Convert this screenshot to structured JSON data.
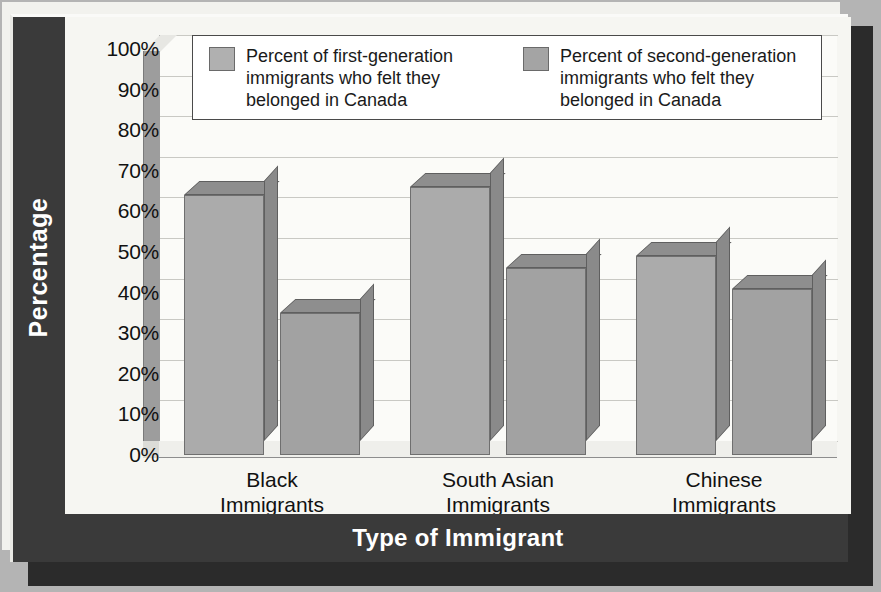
{
  "chart_data": {
    "type": "bar",
    "title": "",
    "subtitle": "",
    "xlabel": "Type of Immigrant",
    "ylabel": "Percentage",
    "categories": [
      "Black\nImmigrants",
      "South Asian\nImmigrants",
      "Chinese\nImmigrants"
    ],
    "category_lines": [
      [
        "Black",
        "Immigrants"
      ],
      [
        "South Asian",
        "Immigrants"
      ],
      [
        "Chinese",
        "Immigrants"
      ]
    ],
    "series": [
      {
        "name": "Percent of first-generation immigrants who felt they belonged in Canada",
        "values": [
          64,
          66,
          49
        ],
        "color": "#ababab"
      },
      {
        "name": "Percent of second-generation immigrants who felt they belonged in Canada",
        "values": [
          35,
          46,
          41
        ],
        "color": "#a2a2a2"
      }
    ],
    "ylim": [
      0,
      100
    ],
    "ytick_values": [
      100,
      90,
      80,
      70,
      60,
      50,
      40,
      30,
      20,
      10,
      0
    ],
    "ytick_labels": [
      "100%",
      "90%",
      "80%",
      "70%",
      "60%",
      "50%",
      "40%",
      "30%",
      "20%",
      "10%",
      "0%"
    ],
    "grid": true,
    "legend_position": "top-inside",
    "style": "3d-bar"
  },
  "legend": {
    "items": [
      {
        "swatch": "a",
        "lines": [
          "Percent of first-generation",
          "immigrants who felt they",
          "belonged in Canada"
        ]
      },
      {
        "swatch": "b",
        "lines": [
          "Percent of second-generation",
          "immigrants who felt they",
          "belonged in Canada"
        ]
      }
    ]
  },
  "colors": {
    "frame": "#3a3a3a",
    "canvas": "#f6f6f2",
    "gridline": "#c9c9c4",
    "series_a": "#ababab",
    "series_b": "#a2a2a2",
    "title_text": "#ffffff"
  }
}
